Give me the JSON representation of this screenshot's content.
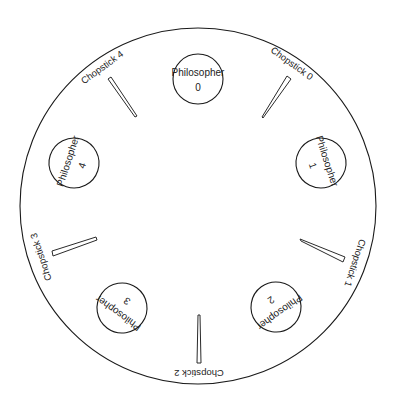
{
  "diagram": {
    "table": {
      "cx": 198,
      "cy": 206,
      "r": 178
    },
    "philosophers": [
      {
        "label": "Philosopher",
        "id": "0",
        "cx": 198,
        "cy": 79,
        "r": 25,
        "rotation": 0
      },
      {
        "label": "Philosopher",
        "id": "1",
        "cx": 321,
        "cy": 163,
        "r": 25,
        "rotation": 72
      },
      {
        "label": "Philosopher",
        "id": "2",
        "cx": 276,
        "cy": 307,
        "r": 25,
        "rotation": 144
      },
      {
        "label": "Philosopher",
        "id": "3",
        "cx": 122,
        "cy": 308,
        "r": 25,
        "rotation": 216
      },
      {
        "label": "Philosopher",
        "id": "4",
        "cx": 74,
        "cy": 163,
        "r": 25,
        "rotation": 288
      }
    ],
    "chopsticks": [
      {
        "label": "Chopstick 0",
        "angle": 36,
        "label_x": 293,
        "label_y": 73
      },
      {
        "label": "Chopstick 1",
        "angle": 108,
        "label_x": 347,
        "label_y": 268
      },
      {
        "label": "Chopstick 2",
        "angle": 180,
        "label_x": 199,
        "label_y": 370
      },
      {
        "label": "Chopstick 3",
        "angle": 252,
        "label_x": 45,
        "label_y": 252
      },
      {
        "label": "Chopstick 4",
        "angle": 324,
        "label_x": 107,
        "label_y": 68
      }
    ],
    "colors": {
      "stroke": "#1a1a1a",
      "text": "#222222",
      "background": "#ffffff"
    }
  }
}
